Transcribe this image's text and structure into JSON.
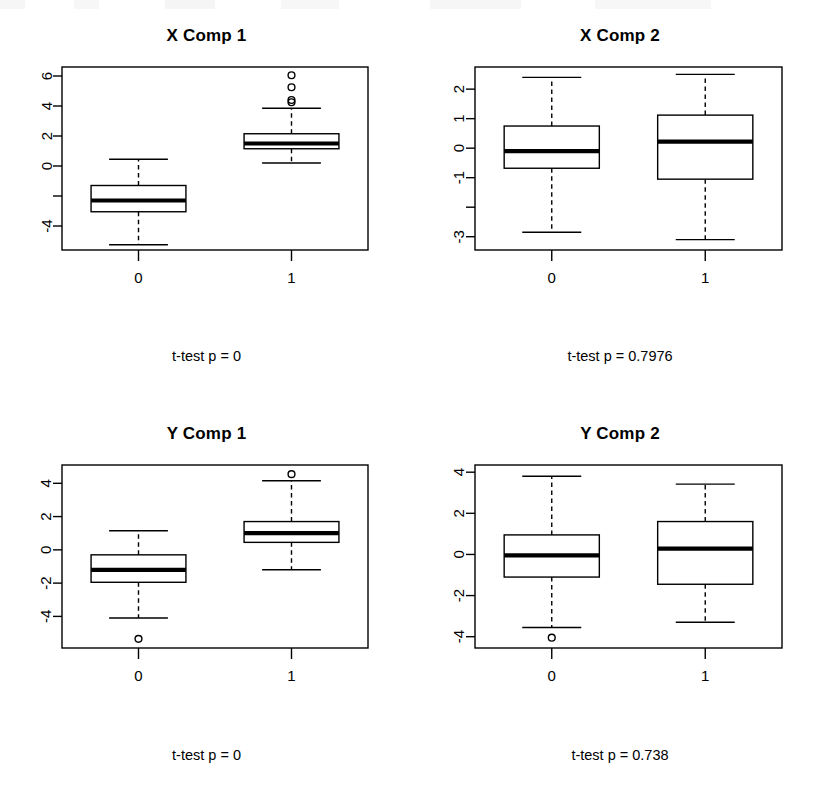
{
  "figure": {
    "title": "",
    "background": "#ffffff",
    "stroke_color": "#000000",
    "layout": "2x2 grid of grouped boxplots"
  },
  "panels": [
    {
      "id": "x-comp-1",
      "title": "X Comp 1",
      "caption": "t-test p = 0",
      "xlabel": "",
      "ylabel": "",
      "x_categories": [
        "0",
        "1"
      ],
      "y_ticks": [
        6,
        4,
        2,
        0,
        -2,
        -4
      ],
      "y_tick_labels": [
        "6",
        "4",
        "2",
        "0",
        "",
        "-4"
      ],
      "ylim": [
        -5.6,
        6.6
      ]
    },
    {
      "id": "x-comp-2",
      "title": "X Comp 2",
      "caption": "t-test p = 0.7976",
      "xlabel": "",
      "ylabel": "",
      "x_categories": [
        "0",
        "1"
      ],
      "y_ticks": [
        2,
        1,
        0,
        -1,
        -2,
        -3
      ],
      "y_tick_labels": [
        "2",
        "1",
        "0",
        "-1",
        "",
        "-3"
      ],
      "ylim": [
        -3.45,
        2.75
      ]
    },
    {
      "id": "y-comp-1",
      "title": "Y Comp 1",
      "caption": "t-test p = 0",
      "xlabel": "",
      "ylabel": "",
      "x_categories": [
        "0",
        "1"
      ],
      "y_ticks": [
        4,
        2,
        0,
        -2,
        -4
      ],
      "y_tick_labels": [
        "4",
        "2",
        "0",
        "-2",
        "-4"
      ],
      "ylim": [
        -5.9,
        5.1
      ]
    },
    {
      "id": "y-comp-2",
      "title": "Y Comp 2",
      "caption": "t-test p = 0.738",
      "xlabel": "",
      "ylabel": "",
      "x_categories": [
        "0",
        "1"
      ],
      "y_ticks": [
        4,
        2,
        0,
        -2,
        -4
      ],
      "y_tick_labels": [
        "4",
        "2",
        "0",
        "-2",
        "-4"
      ],
      "ylim": [
        -4.55,
        4.35
      ]
    }
  ],
  "chart_data": [
    {
      "type": "box",
      "title": "X Comp 1",
      "subtitle": "t-test p = 0",
      "xlabel": "",
      "ylabel": "",
      "categories": [
        "0",
        "1"
      ],
      "ylim": [
        -5.6,
        6.6
      ],
      "y_ticks": [
        6,
        4,
        2,
        0,
        -2,
        -4
      ],
      "grid": false,
      "legend": "none",
      "boxes": [
        {
          "category": "0",
          "min": -5.25,
          "q1": -3.05,
          "median": -2.3,
          "q3": -1.3,
          "max": 0.45,
          "outliers": []
        },
        {
          "category": "1",
          "min": 0.2,
          "q1": 1.15,
          "median": 1.5,
          "q3": 2.15,
          "max": 3.85,
          "outliers": [
            6.05,
            5.25,
            4.4,
            4.25
          ]
        }
      ]
    },
    {
      "type": "box",
      "title": "X Comp 2",
      "subtitle": "t-test p = 0.7976",
      "xlabel": "",
      "ylabel": "",
      "categories": [
        "0",
        "1"
      ],
      "ylim": [
        -3.45,
        2.75
      ],
      "y_ticks": [
        2,
        1,
        0,
        -1,
        -2,
        -3
      ],
      "grid": false,
      "legend": "none",
      "boxes": [
        {
          "category": "0",
          "min": -2.85,
          "q1": -0.68,
          "median": -0.1,
          "q3": 0.75,
          "max": 2.4,
          "outliers": []
        },
        {
          "category": "1",
          "min": -3.1,
          "q1": -1.05,
          "median": 0.22,
          "q3": 1.12,
          "max": 2.5,
          "outliers": []
        }
      ]
    },
    {
      "type": "box",
      "title": "Y Comp 1",
      "subtitle": "t-test p = 0",
      "xlabel": "",
      "ylabel": "",
      "categories": [
        "0",
        "1"
      ],
      "ylim": [
        -5.9,
        5.1
      ],
      "y_ticks": [
        4,
        2,
        0,
        -2,
        -4
      ],
      "grid": false,
      "legend": "none",
      "boxes": [
        {
          "category": "0",
          "min": -4.1,
          "q1": -1.95,
          "median": -1.2,
          "q3": -0.3,
          "max": 1.15,
          "outliers": [
            -5.35
          ]
        },
        {
          "category": "1",
          "min": -1.2,
          "q1": 0.45,
          "median": 1.0,
          "q3": 1.7,
          "max": 4.15,
          "outliers": [
            4.55
          ]
        }
      ]
    },
    {
      "type": "box",
      "title": "Y Comp 2",
      "subtitle": "t-test p = 0.738",
      "xlabel": "",
      "ylabel": "",
      "categories": [
        "0",
        "1"
      ],
      "ylim": [
        -4.55,
        4.35
      ],
      "y_ticks": [
        4,
        2,
        0,
        -2,
        -4
      ],
      "grid": false,
      "legend": "none",
      "boxes": [
        {
          "category": "0",
          "min": -3.55,
          "q1": -1.1,
          "median": -0.05,
          "q3": 0.95,
          "max": 3.8,
          "outliers": [
            -4.05
          ]
        },
        {
          "category": "1",
          "min": -3.3,
          "q1": -1.45,
          "median": 0.28,
          "q3": 1.6,
          "max": 3.42,
          "outliers": []
        }
      ]
    }
  ]
}
